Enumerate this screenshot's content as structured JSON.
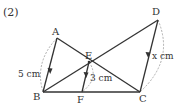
{
  "problem_number": "(2)",
  "points": {
    "A": {
      "label": "A",
      "x": 57,
      "y": 38
    },
    "B": {
      "label": "B",
      "x": 43,
      "y": 92
    },
    "C": {
      "label": "C",
      "x": 140,
      "y": 92
    },
    "D": {
      "label": "D",
      "x": 158,
      "y": 20
    },
    "E": {
      "label": "E",
      "x": 89,
      "y": 62
    },
    "F": {
      "label": "F",
      "x": 82,
      "y": 92
    }
  },
  "measurements": {
    "AB": "5 cm",
    "EF": "3 cm",
    "DC": "x cm"
  },
  "colors": {
    "line": "#333333",
    "dashed": "#999999",
    "text": "#333333"
  }
}
